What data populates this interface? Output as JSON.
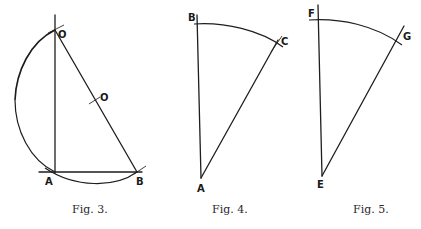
{
  "figures": [
    {
      "caption": "Fig. 3.",
      "labels": {
        "top": "O",
        "mid": "O",
        "left": "A",
        "right": "B"
      },
      "points": {
        "A": [
          55,
          172
        ],
        "B": [
          137,
          172
        ],
        "top": [
          55,
          30
        ],
        "mid": [
          96,
          101
        ]
      }
    },
    {
      "caption": "Fig. 4.",
      "labels": {
        "top": "B",
        "bottom": "A",
        "right": "C"
      },
      "points": {
        "B": [
          197,
          24
        ],
        "A": [
          201,
          178
        ],
        "C": [
          278,
          44
        ]
      }
    },
    {
      "caption": "Fig. 5.",
      "labels": {
        "top": "F",
        "bottom": "E",
        "right": "G"
      },
      "points": {
        "F": [
          318,
          20
        ],
        "E": [
          322,
          176
        ],
        "G": [
          399,
          40
        ]
      }
    }
  ],
  "colors": {
    "ink": "#1e1e1e",
    "paper": "#ffffff"
  }
}
